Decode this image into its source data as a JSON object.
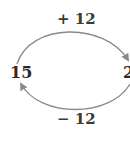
{
  "diagram": {
    "nodes": {
      "left": "15",
      "right": "2"
    },
    "operations": {
      "forward": "+ 12",
      "backward": "− 12"
    },
    "colors": {
      "arc": "#8a8a8a",
      "text": "#3a3a3a"
    }
  }
}
